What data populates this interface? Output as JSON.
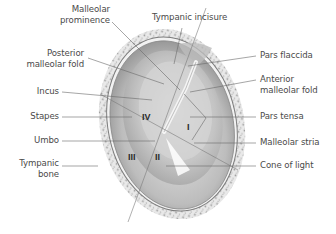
{
  "figure": {
    "quadrants": [
      "I",
      "II",
      "III",
      "IV"
    ],
    "colors": {
      "membrane_outer": "#8f8f8f",
      "membrane_mid": "#b9b9b9",
      "membrane_light": "#dcdcdc",
      "bone_speckle": "#9a9a9a",
      "leader_line": "#6a6a6a",
      "label_text": "#4a4a4a"
    }
  },
  "labels_left": [
    {
      "id": "malleolar-prominence",
      "lines": [
        "Malleolar",
        "prominence"
      ]
    },
    {
      "id": "posterior-malleolar-fold",
      "lines": [
        "Posterior",
        "malleolar fold"
      ]
    },
    {
      "id": "incus",
      "lines": [
        "Incus"
      ]
    },
    {
      "id": "stapes",
      "lines": [
        "Stapes"
      ]
    },
    {
      "id": "umbo",
      "lines": [
        "Umbo"
      ]
    },
    {
      "id": "tympanic-bone",
      "lines": [
        "Tympanic",
        "bone"
      ]
    }
  ],
  "labels_right": [
    {
      "id": "tympanic-incisure",
      "lines": [
        "Tympanic incisure"
      ]
    },
    {
      "id": "pars-flaccida",
      "lines": [
        "Pars flaccida"
      ]
    },
    {
      "id": "anterior-malleolar-fold",
      "lines": [
        "Anterior",
        "malleolar fold"
      ]
    },
    {
      "id": "pars-tensa",
      "lines": [
        "Pars tensa"
      ]
    },
    {
      "id": "malleolar-stria",
      "lines": [
        "Malleolar stria"
      ]
    },
    {
      "id": "cone-of-light",
      "lines": [
        "Cone of light"
      ]
    }
  ]
}
